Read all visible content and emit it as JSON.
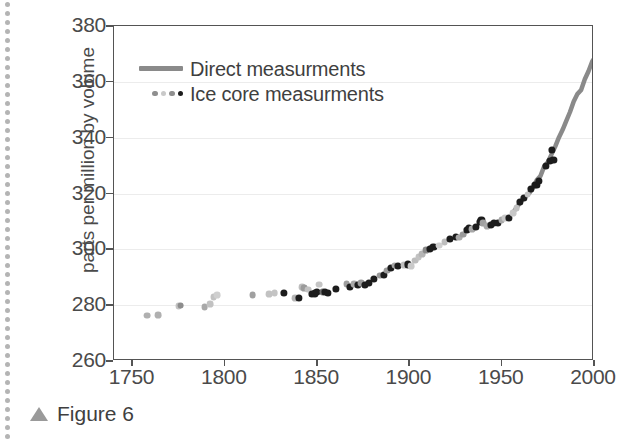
{
  "figure": {
    "caption_marker": "triangle-up",
    "caption_text": "Figure 6"
  },
  "legend": {
    "position": "top-left-inside",
    "items": [
      {
        "label": "Direct measurments",
        "marker": "line",
        "color": "#8a8a8a"
      },
      {
        "label": "Ice core measurments",
        "marker": "dots",
        "colors": [
          "#8f8f8f",
          "#c9c9c9",
          "#8f8f8f",
          "#1c1c1c"
        ]
      }
    ]
  },
  "chart_data": {
    "type": "scatter",
    "title": "",
    "xlabel": "",
    "ylabel": "parts per million by volume",
    "xlim": [
      1740,
      2000
    ],
    "ylim": [
      260,
      380
    ],
    "xticks": [
      1750,
      1800,
      1850,
      1900,
      1950,
      2000
    ],
    "yticks": [
      260,
      280,
      300,
      320,
      340,
      360,
      380
    ],
    "grid": "horizontal",
    "series": [
      {
        "name": "Ice core measurments",
        "type": "scatter",
        "points": [
          [
            1758,
            276.3,
            "#b0b0b0"
          ],
          [
            1764,
            276.4,
            "#b0b0b0"
          ],
          [
            1775,
            279.6,
            "#c2c2c2"
          ],
          [
            1776,
            279.8,
            "#8d8d8d"
          ],
          [
            1789,
            279.3,
            "#a9a9a9"
          ],
          [
            1792,
            280.5,
            "#c2c2c2"
          ],
          [
            1794,
            283.0,
            "#c2c2c2"
          ],
          [
            1796,
            283.5,
            "#cfcfcf"
          ],
          [
            1815,
            283.5,
            "#a0a0a0"
          ],
          [
            1824,
            284.0,
            "#c2c2c2"
          ],
          [
            1827,
            284.4,
            "#c4c4c4"
          ],
          [
            1832,
            284.3,
            "#1c1c1c"
          ],
          [
            1838,
            282.6,
            "#b5b5b5"
          ],
          [
            1840,
            282.5,
            "#1c1c1c"
          ],
          [
            1842,
            286.5,
            "#bdbdbd"
          ],
          [
            1843,
            286.2,
            "#9a9a9a"
          ],
          [
            1845,
            285.6,
            "#c2c2c2"
          ],
          [
            1847,
            284.0,
            "#1c1c1c"
          ],
          [
            1849,
            284.2,
            "#1c1c1c"
          ],
          [
            1850,
            284.7,
            "#1c1c1c"
          ],
          [
            1851,
            287.4,
            "#c4c4c4"
          ],
          [
            1853,
            284.6,
            "#6e6e6e"
          ],
          [
            1854,
            284.6,
            "#1c1c1c"
          ],
          [
            1856,
            284.4,
            "#1c1c1c"
          ],
          [
            1860,
            285.8,
            "#1c1c1c"
          ],
          [
            1866,
            287.5,
            "#9e9e9e"
          ],
          [
            1868,
            286.7,
            "#1c1c1c"
          ],
          [
            1870,
            287.6,
            "#a8a8a8"
          ],
          [
            1872,
            287.1,
            "#1c1c1c"
          ],
          [
            1874,
            288.0,
            "#9a9a9a"
          ],
          [
            1876,
            287.2,
            "#1c1c1c"
          ],
          [
            1878,
            288.0,
            "#1c1c1c"
          ],
          [
            1881,
            289.4,
            "#1c1c1c"
          ],
          [
            1884,
            290.6,
            "#9a9a9a"
          ],
          [
            1886,
            291.0,
            "#1c1c1c"
          ],
          [
            1888,
            292.4,
            "#9a9a9a"
          ],
          [
            1890,
            293.5,
            "#1c1c1c"
          ],
          [
            1892,
            294.2,
            "#a5a5a5"
          ],
          [
            1894,
            294.0,
            "#1c1c1c"
          ],
          [
            1897,
            294.3,
            "#c0c0c0"
          ],
          [
            1899,
            294.6,
            "#1c1c1c"
          ],
          [
            1901,
            294.0,
            "#cacaca"
          ],
          [
            1903,
            296.0,
            "#bdbdbd"
          ],
          [
            1905,
            297.2,
            "#c2c2c2"
          ],
          [
            1907,
            298.3,
            "#b5b5b5"
          ],
          [
            1909,
            299.6,
            "#8a8a8a"
          ],
          [
            1911,
            300.3,
            "#1c1c1c"
          ],
          [
            1913,
            300.9,
            "#1c1c1c"
          ],
          [
            1916,
            301.3,
            "#cfcfcf"
          ],
          [
            1919,
            302.5,
            "#bdbdbd"
          ],
          [
            1922,
            303.6,
            "#1c1c1c"
          ],
          [
            1925,
            304.4,
            "#1c1c1c"
          ],
          [
            1927,
            304.2,
            "#aaaaaa"
          ],
          [
            1929,
            305.3,
            "#9a9a9a"
          ],
          [
            1931,
            306.8,
            "#1c1c1c"
          ],
          [
            1932,
            307.6,
            "#1c1c1c"
          ],
          [
            1934,
            307.3,
            "#a8a8a8"
          ],
          [
            1936,
            308.1,
            "#1c1c1c"
          ],
          [
            1938,
            309.8,
            "#1c1c1c"
          ],
          [
            1939,
            310.5,
            "#1c1c1c"
          ],
          [
            1940,
            309.4,
            "#a0a0a0"
          ],
          [
            1942,
            308.4,
            "#a8a8a8"
          ],
          [
            1944,
            308.9,
            "#1c1c1c"
          ],
          [
            1946,
            309.5,
            "#1c1c1c"
          ],
          [
            1948,
            309.6,
            "#1c1c1c"
          ],
          [
            1950,
            310.5,
            "#a8a8a8"
          ],
          [
            1952,
            311.2,
            "#c7c7c7"
          ],
          [
            1954,
            311.4,
            "#1c1c1c"
          ],
          [
            1956,
            313.0,
            "#c7c7c7"
          ],
          [
            1958,
            314.7,
            "#c0c0c0"
          ],
          [
            1960,
            316.9,
            "#1c1c1c"
          ],
          [
            1962,
            318.4,
            "#1c1c1c"
          ],
          [
            1964,
            319.6,
            "#c0c0c0"
          ],
          [
            1966,
            321.5,
            "#1c1c1c"
          ],
          [
            1968,
            323.0,
            "#1c1c1c"
          ],
          [
            1969,
            323.2,
            "#1c1c1c"
          ],
          [
            1970,
            324.4,
            "#1c1c1c"
          ],
          [
            1974,
            330.0,
            "#1c1c1c"
          ],
          [
            1976,
            331.8,
            "#1c1c1c"
          ],
          [
            1977,
            335.5,
            "#1c1c1c"
          ],
          [
            1978,
            332.0,
            "#1c1c1c"
          ]
        ]
      },
      {
        "name": "Direct measurments",
        "type": "line",
        "color": "#8a8a8a",
        "points": [
          [
            1957,
            314.0
          ],
          [
            1959,
            315.8
          ],
          [
            1961,
            317.6
          ],
          [
            1963,
            319.0
          ],
          [
            1965,
            320.2
          ],
          [
            1967,
            322.2
          ],
          [
            1969,
            324.8
          ],
          [
            1971,
            326.3
          ],
          [
            1973,
            329.7
          ],
          [
            1975,
            331.2
          ],
          [
            1977,
            334.0
          ],
          [
            1979,
            336.8
          ],
          [
            1981,
            340.1
          ],
          [
            1983,
            342.8
          ],
          [
            1985,
            346.0
          ],
          [
            1987,
            349.2
          ],
          [
            1989,
            353.0
          ],
          [
            1991,
            355.6
          ],
          [
            1993,
            357.1
          ],
          [
            1995,
            360.9
          ],
          [
            1997,
            363.8
          ],
          [
            1999,
            367.3
          ],
          [
            2000,
            368.3
          ]
        ]
      }
    ]
  }
}
